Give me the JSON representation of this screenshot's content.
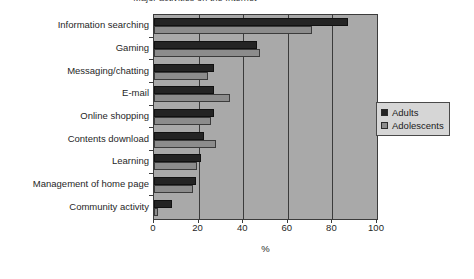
{
  "chart_data": {
    "type": "bar",
    "orientation": "horizontal",
    "title": "Major activities on the Internet",
    "xlabel": "%",
    "ylabel": "",
    "xlim": [
      0,
      100
    ],
    "xticks": [
      0,
      20,
      40,
      60,
      80,
      100
    ],
    "grid": true,
    "legend_position": "right",
    "categories": [
      "Information searching",
      "Gaming",
      "Messaging/chatting",
      "E-mail",
      "Online shopping",
      "Contents download",
      "Learning",
      "Management of home page",
      "Community activity"
    ],
    "series": [
      {
        "name": "Adults",
        "color": "#242424",
        "values": [
          87,
          46,
          27,
          27,
          27,
          22.5,
          21,
          19,
          8
        ]
      },
      {
        "name": "Adolescents",
        "color": "#8c8c8c",
        "values": [
          71,
          47.5,
          24,
          34,
          25.5,
          28,
          19.5,
          17.5,
          2
        ]
      }
    ]
  },
  "legend": {
    "items": [
      {
        "label": "Adults",
        "swatch": "adults"
      },
      {
        "label": "Adolescents",
        "swatch": "adolescents"
      }
    ]
  },
  "axis": {
    "x_title": "%"
  }
}
